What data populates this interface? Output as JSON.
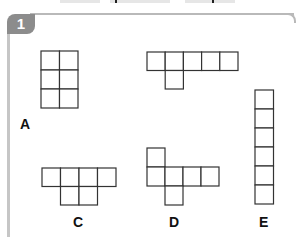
{
  "exercise": {
    "number": "1",
    "badge_color": "#8c8c8c",
    "line_color": "#333333"
  },
  "shapes": [
    {
      "label": "A",
      "description": "2 by 3 rectangle of squares",
      "cells": [
        [
          0,
          0
        ],
        [
          1,
          0
        ],
        [
          0,
          1
        ],
        [
          1,
          1
        ],
        [
          0,
          2
        ],
        [
          1,
          2
        ]
      ]
    },
    {
      "label": "B",
      "description": "row of 5 squares with one square below the second",
      "cells": [
        [
          0,
          0
        ],
        [
          1,
          0
        ],
        [
          2,
          0
        ],
        [
          3,
          0
        ],
        [
          4,
          0
        ],
        [
          1,
          1
        ]
      ]
    },
    {
      "label": "C",
      "description": "row of 4 squares with two squares below the middle two",
      "cells": [
        [
          0,
          0
        ],
        [
          1,
          0
        ],
        [
          2,
          0
        ],
        [
          3,
          0
        ],
        [
          1,
          1
        ],
        [
          2,
          1
        ]
      ]
    },
    {
      "label": "D",
      "description": "row of 4 squares with one square above the first and one below the second",
      "cells": [
        [
          0,
          0
        ],
        [
          0,
          1
        ],
        [
          1,
          1
        ],
        [
          2,
          1
        ],
        [
          3,
          1
        ],
        [
          1,
          2
        ]
      ]
    },
    {
      "label": "E",
      "description": "column of 6 squares",
      "cells": [
        [
          0,
          0
        ],
        [
          0,
          1
        ],
        [
          0,
          2
        ],
        [
          0,
          3
        ],
        [
          0,
          4
        ],
        [
          0,
          5
        ]
      ]
    }
  ],
  "labels": {
    "A": "A",
    "C": "C",
    "D": "D",
    "E": "E"
  }
}
